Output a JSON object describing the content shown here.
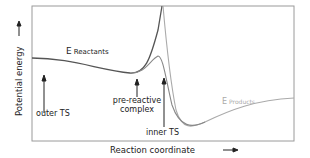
{
  "diagram": {
    "y_axis_label": "Potential energy",
    "x_axis_label": "Reaction coordinate",
    "curves": {
      "reactants": {
        "label_main": "E",
        "label_sub": "Reactants",
        "color": "#555555"
      },
      "products": {
        "label_main": "E",
        "label_sub": "Products",
        "color": "#aaaaaa"
      },
      "adiabatic": {
        "color": "#888888"
      }
    },
    "annotations": {
      "outer_ts": "outer TS",
      "pre_reactive_line1": "pre-reactive",
      "pre_reactive_line2": "complex",
      "inner_ts": "inner TS"
    },
    "frame_color": "#999999"
  }
}
